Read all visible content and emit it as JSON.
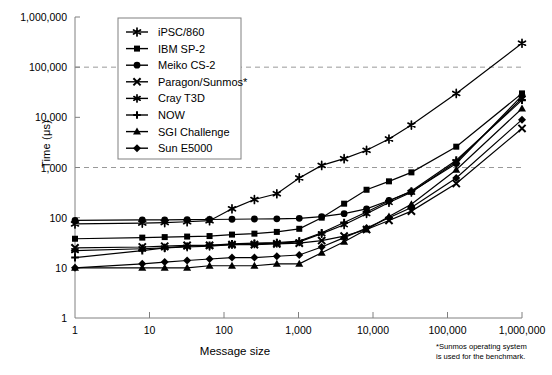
{
  "chart_data": {
    "type": "line",
    "title": "",
    "xlabel": "Message size",
    "ylabel": "Time (μs)",
    "xscale": "log",
    "yscale": "log",
    "xlim": [
      1,
      1000000
    ],
    "ylim": [
      1,
      1000000
    ],
    "xticks": [
      "1",
      "10",
      "100",
      "1,000",
      "10,000",
      "100,000",
      "1,000,000"
    ],
    "xtick_values": [
      1,
      10,
      100,
      1000,
      10000,
      100000,
      1000000
    ],
    "yticks": [
      "1",
      "10",
      "100",
      "1,000",
      "10,000",
      "100,000",
      "1,000,000"
    ],
    "ytick_values": [
      1,
      10,
      100,
      1000,
      10000,
      100000,
      1000000
    ],
    "grid": "horizontal-dashed at 1,000 and 100,000",
    "gridline_values": [
      1000,
      100000
    ],
    "legend_position": "top-left",
    "annotation": "*Sunmos operating system is used for the benchmark.",
    "x": [
      1,
      8,
      16,
      32,
      64,
      128,
      256,
      512,
      1024,
      2048,
      4096,
      8192,
      16384,
      32768,
      131072,
      1000000
    ],
    "series": [
      {
        "name": "iPSC/860",
        "marker": "star",
        "values": [
          75,
          78,
          80,
          83,
          87,
          150,
          230,
          300,
          620,
          1100,
          1500,
          2200,
          3700,
          7000,
          30000,
          300000
        ]
      },
      {
        "name": "IBM SP-2",
        "marker": "square",
        "values": [
          38,
          40,
          41,
          42,
          43,
          46,
          48,
          52,
          60,
          100,
          190,
          360,
          530,
          800,
          2600,
          30000
        ]
      },
      {
        "name": "Meiko CS-2",
        "marker": "circle",
        "values": [
          88,
          90,
          90,
          91,
          92,
          93,
          94,
          95,
          97,
          105,
          120,
          150,
          220,
          330,
          1200,
          27000
        ]
      },
      {
        "name": "Paragon/Sunmos*",
        "marker": "x",
        "values": [
          25,
          26,
          27,
          28,
          28,
          29,
          29,
          30,
          31,
          35,
          43,
          58,
          88,
          135,
          480,
          6000
        ]
      },
      {
        "name": "Cray T3D",
        "marker": "star-small",
        "values": [
          22,
          24,
          25,
          26,
          27,
          29,
          30,
          31,
          33,
          48,
          72,
          120,
          200,
          320,
          1300,
          24000
        ]
      },
      {
        "name": "NOW",
        "marker": "plus",
        "values": [
          16,
          22,
          25,
          27,
          28,
          30,
          31,
          32,
          34,
          50,
          80,
          130,
          215,
          340,
          1400,
          22000
        ]
      },
      {
        "name": "SGI Challenge",
        "marker": "triangle",
        "values": [
          10,
          10,
          10,
          10,
          11,
          11,
          11,
          12,
          12,
          20,
          33,
          58,
          105,
          185,
          900,
          15000
        ]
      },
      {
        "name": "Sun E5000",
        "marker": "diamond",
        "values": [
          10,
          12,
          13,
          14,
          15,
          16,
          16,
          17,
          18,
          26,
          40,
          62,
          100,
          160,
          620,
          9000
        ]
      }
    ]
  },
  "legend": {
    "items": [
      {
        "label": "iPSC/860"
      },
      {
        "label": "IBM SP-2"
      },
      {
        "label": "Meiko CS-2"
      },
      {
        "label": "Paragon/Sunmos*"
      },
      {
        "label": "Cray T3D"
      },
      {
        "label": "NOW"
      },
      {
        "label": "SGI Challenge"
      },
      {
        "label": "Sun E5000"
      }
    ]
  },
  "axes": {
    "y_title": "Time (μs)",
    "x_title": "Message size"
  },
  "footnote": {
    "line1": "*Sunmos operating system",
    "line2": "is used for the benchmark."
  },
  "colors": {
    "line": "#000000",
    "grid": "#999999",
    "axis": "#808080",
    "background": "#ffffff"
  }
}
